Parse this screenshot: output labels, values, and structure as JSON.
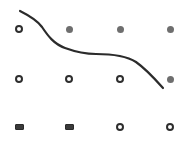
{
  "board": {
    "rows": 3,
    "cols": 4,
    "colors": {
      "ring": "#2e2e2e",
      "dot": "#6e6e6e",
      "rect": "#3a3a3a",
      "curve": "#2b2b2b",
      "background": "#ffffff"
    },
    "nodes": [
      {
        "row": 0,
        "col": 0,
        "x": 19,
        "y": 29,
        "type": "ring"
      },
      {
        "row": 0,
        "col": 1,
        "x": 69,
        "y": 29,
        "type": "dot"
      },
      {
        "row": 0,
        "col": 2,
        "x": 120,
        "y": 29,
        "type": "dot"
      },
      {
        "row": 0,
        "col": 3,
        "x": 170,
        "y": 29,
        "type": "dot"
      },
      {
        "row": 1,
        "col": 0,
        "x": 19,
        "y": 79,
        "type": "ring"
      },
      {
        "row": 1,
        "col": 1,
        "x": 69,
        "y": 79,
        "type": "ring"
      },
      {
        "row": 1,
        "col": 2,
        "x": 120,
        "y": 79,
        "type": "ring"
      },
      {
        "row": 1,
        "col": 3,
        "x": 170,
        "y": 79,
        "type": "dot"
      },
      {
        "row": 2,
        "col": 0,
        "x": 19,
        "y": 127,
        "type": "rect"
      },
      {
        "row": 2,
        "col": 1,
        "x": 69,
        "y": 127,
        "type": "rect"
      },
      {
        "row": 2,
        "col": 2,
        "x": 120,
        "y": 127,
        "type": "ring"
      },
      {
        "row": 2,
        "col": 3,
        "x": 170,
        "y": 127,
        "type": "ring"
      }
    ],
    "curve": {
      "path": "M20,11 C30,16 37,20 42,27 C48,36 54,44 65,48 C76,52 85,54 96,54 C110,54 125,55 136,62 C146,69 155,79 163,88",
      "stroke_width": 2.2
    }
  }
}
